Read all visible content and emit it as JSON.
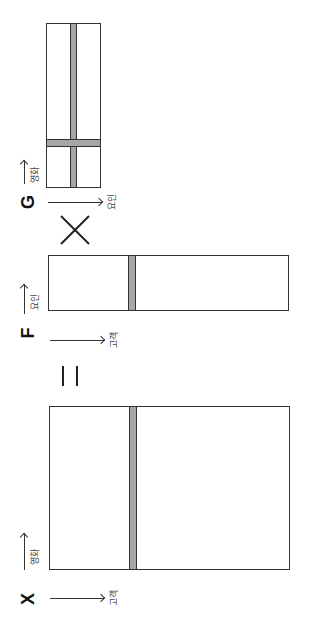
{
  "diagram": {
    "orientation": "rotated 90° counter-clockwise",
    "matrices": [
      {
        "id": "X",
        "letter": "X",
        "row_axis_label": "고객",
        "col_axis_label": "영화",
        "highlight": "one row (customer) highlighted"
      },
      {
        "id": "F",
        "letter": "F",
        "row_axis_label": "고객",
        "col_axis_label": "요인",
        "highlight": "one row (customer) highlighted"
      },
      {
        "id": "G",
        "letter": "G",
        "row_axis_label": "요인",
        "col_axis_label": "영화",
        "highlight": "one row and one column highlighted"
      }
    ],
    "operators": {
      "equals": "=",
      "times": "×"
    },
    "colors": {
      "stroke": "#333333",
      "highlight": "#a6a6a6",
      "background": "#ffffff"
    }
  }
}
